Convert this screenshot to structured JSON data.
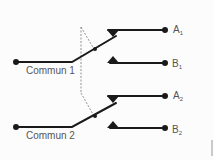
{
  "diagram": {
    "type": "double-pole double-throw switch (2RT)",
    "colors": {
      "wire": "#1a1a1a",
      "dashed_link": "#777777",
      "label": "#555555",
      "background": "#fcfcfc"
    },
    "commons": [
      {
        "label": "Commun 1"
      },
      {
        "label": "Commun 2"
      }
    ],
    "contacts": [
      {
        "letter": "A",
        "index": "1"
      },
      {
        "letter": "B",
        "index": "1"
      },
      {
        "letter": "A",
        "index": "2"
      },
      {
        "letter": "B",
        "index": "2"
      }
    ]
  }
}
